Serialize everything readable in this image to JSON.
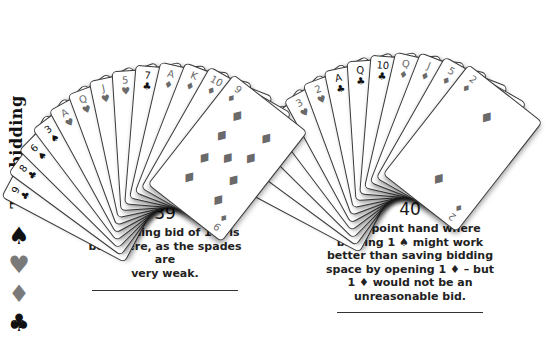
{
  "sidebar": {
    "title": "The bidding",
    "suits": [
      {
        "name": "spade",
        "glyph": "♠",
        "color": "#111111"
      },
      {
        "name": "heart",
        "glyph": "♥",
        "color": "#7a7a7a"
      },
      {
        "name": "diamond",
        "glyph": "♦",
        "color": "#7a7a7a"
      },
      {
        "name": "club",
        "glyph": "♣",
        "color": "#111111"
      }
    ],
    "page_number": "62"
  },
  "hands": [
    {
      "number": "39",
      "caption_lines": [
        "An opening bid of 1 ♥ is",
        "best here, as the spades are",
        "very weak."
      ],
      "cards": [
        {
          "rank": "9",
          "suit": "♣"
        },
        {
          "rank": "8",
          "suit": "♣"
        },
        {
          "rank": "6",
          "suit": "♠"
        },
        {
          "rank": "3",
          "suit": "♠"
        },
        {
          "rank": "A",
          "suit": "♥"
        },
        {
          "rank": "Q",
          "suit": "♥"
        },
        {
          "rank": "J",
          "suit": "♥"
        },
        {
          "rank": "5",
          "suit": "♥"
        },
        {
          "rank": "7",
          "suit": "♣"
        },
        {
          "rank": "A",
          "suit": "♦"
        },
        {
          "rank": "K",
          "suit": "♦"
        },
        {
          "rank": "10",
          "suit": "♦"
        },
        {
          "rank": "9",
          "suit": "♦"
        }
      ]
    },
    {
      "number": "40",
      "caption_lines": [
        "A 16-point hand where",
        "bidding 1 ♠ might work",
        "better than saving bidding",
        "space by opening 1 ♦ – but",
        "1 ♦ would not be an",
        "unreasonable bid."
      ],
      "cards": [
        {
          "rank": "A",
          "suit": "♠"
        },
        {
          "rank": "K",
          "suit": "♠"
        },
        {
          "rank": "10",
          "suit": "♠"
        },
        {
          "rank": "8",
          "suit": "♠"
        },
        {
          "rank": "3",
          "suit": "♥"
        },
        {
          "rank": "2",
          "suit": "♥"
        },
        {
          "rank": "A",
          "suit": "♣"
        },
        {
          "rank": "Q",
          "suit": "♣"
        },
        {
          "rank": "10",
          "suit": "♣"
        },
        {
          "rank": "Q",
          "suit": "♦"
        },
        {
          "rank": "J",
          "suit": "♦"
        },
        {
          "rank": "5",
          "suit": "♦"
        },
        {
          "rank": "2",
          "suit": "♦"
        }
      ]
    }
  ],
  "colors": {
    "black_suit": "#111111",
    "red_suit_print": "#6a6a6a",
    "rule": "#333333"
  }
}
